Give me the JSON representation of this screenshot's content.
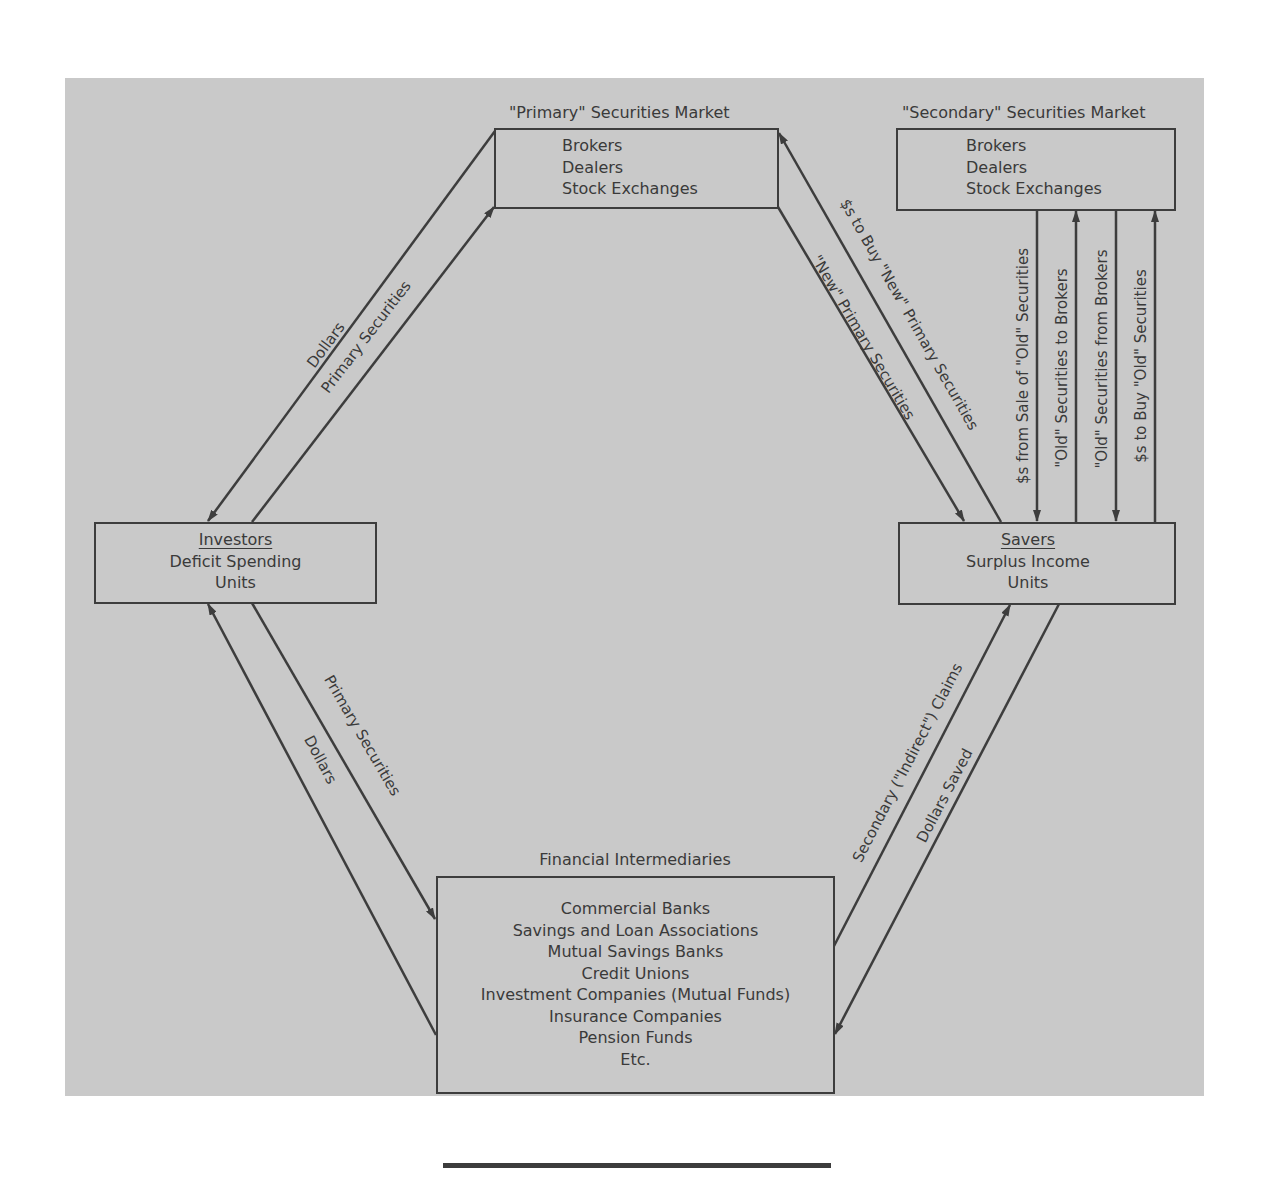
{
  "diagram": {
    "type": "flow-of-funds",
    "colors": {
      "background": "#c9c9c9",
      "line": "#3d3d3d",
      "text": "#3a3a3a"
    },
    "nodes": {
      "primary_market": {
        "title": "\"Primary\" Securities Market",
        "lines": [
          "Brokers",
          "Dealers",
          "Stock Exchanges"
        ]
      },
      "secondary_market": {
        "title": "\"Secondary\" Securities Market",
        "lines": [
          "Brokers",
          "Dealers",
          "Stock Exchanges"
        ]
      },
      "investors": {
        "heading": "Investors",
        "lines": [
          "Deficit Spending",
          "Units"
        ]
      },
      "savers": {
        "heading": "Savers",
        "lines": [
          "Surplus Income",
          "Units"
        ]
      },
      "intermediaries": {
        "title": "Financial Intermediaries",
        "lines": [
          "Commercial Banks",
          "Savings and Loan Associations",
          "Mutual Savings Banks",
          "Credit Unions",
          "Investment Companies (Mutual Funds)",
          "Insurance Companies",
          "Pension Funds",
          "Etc."
        ]
      }
    },
    "edges": {
      "primary_to_investors": {
        "label": "Dollars",
        "from": "primary_market",
        "to": "investors"
      },
      "investors_to_primary": {
        "label": "Primary Securities",
        "from": "investors",
        "to": "primary_market"
      },
      "savers_to_primary": {
        "label": "$s to Buy \"New\" Primary Securities",
        "from": "savers",
        "to": "primary_market"
      },
      "primary_to_savers": {
        "label": "\"New\" Primary Securities",
        "from": "primary_market",
        "to": "savers"
      },
      "secondary_to_savers_dollars": {
        "label": "$s from Sale of \"Old\" Securities",
        "from": "secondary_market",
        "to": "savers"
      },
      "savers_to_secondary_old": {
        "label": "\"Old\" Securities to Brokers",
        "from": "savers",
        "to": "secondary_market"
      },
      "secondary_to_savers_old": {
        "label": "\"Old\" Securities from Brokers",
        "from": "secondary_market",
        "to": "savers"
      },
      "savers_to_secondary_dollars": {
        "label": "$s to Buy \"Old\" Securities",
        "from": "savers",
        "to": "secondary_market"
      },
      "investors_to_fi": {
        "label": "Primary Securities",
        "from": "investors",
        "to": "intermediaries"
      },
      "fi_to_investors": {
        "label": "Dollars",
        "from": "intermediaries",
        "to": "investors"
      },
      "fi_to_savers": {
        "label": "Secondary (\"Indirect\") Claims",
        "from": "intermediaries",
        "to": "savers"
      },
      "savers_to_fi": {
        "label": "Dollars Saved",
        "from": "savers",
        "to": "intermediaries"
      }
    }
  }
}
